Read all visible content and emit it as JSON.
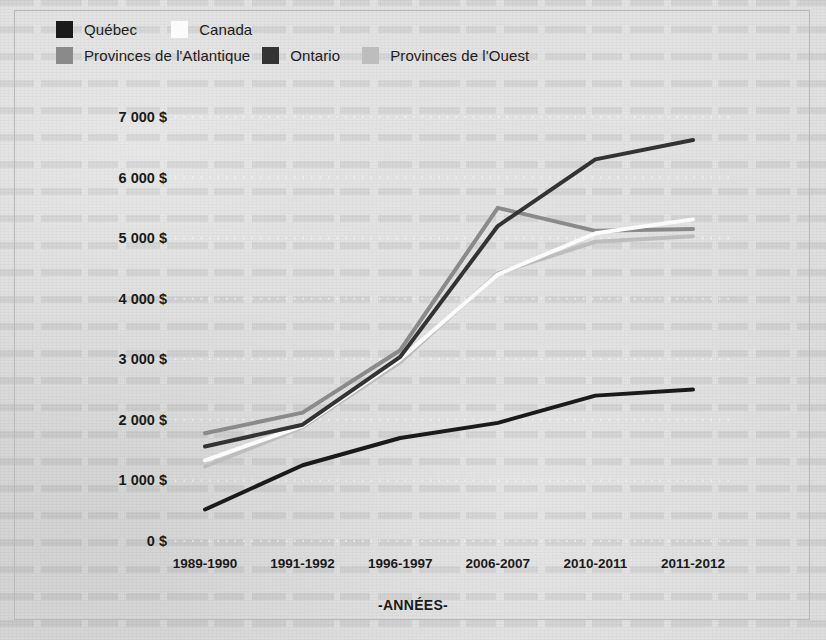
{
  "chart_data": {
    "type": "line",
    "title": "",
    "xlabel": "-ANNÉES-",
    "ylabel": "",
    "categories": [
      "1989-1990",
      "1991-1992",
      "1996-1997",
      "2006-2007",
      "2010-2011",
      "2011-2012"
    ],
    "ylim": [
      0,
      7000
    ],
    "ytick_values": [
      0,
      1000,
      2000,
      3000,
      4000,
      5000,
      6000,
      7000
    ],
    "ytick_labels": [
      "0 $",
      "1 000 $",
      "2 000 $",
      "3 000 $",
      "4 000 $",
      "5 000 $",
      "6 000 $",
      "7 000 $"
    ],
    "grid": "horizontal-dotted",
    "legend_position": "top-left",
    "series": [
      {
        "name": "Québec",
        "color": "#1a1a1a",
        "values": [
          520,
          1250,
          1700,
          1950,
          2400,
          2500
        ]
      },
      {
        "name": "Canada",
        "color": "#fbfbfb",
        "values": [
          1330,
          1900,
          3000,
          4400,
          5080,
          5310
        ]
      },
      {
        "name": "Provinces de l'Atlantique",
        "color": "#8a8a8a",
        "values": [
          1780,
          2120,
          3150,
          5500,
          5120,
          5150
        ]
      },
      {
        "name": "Ontario",
        "color": "#333333",
        "values": [
          1560,
          1920,
          3040,
          5200,
          6300,
          6620
        ]
      },
      {
        "name": "Provinces de l'Ouest",
        "color": "#bdbdbd",
        "values": [
          1230,
          1880,
          2950,
          4420,
          4940,
          5030
        ]
      }
    ]
  },
  "legend": {
    "rows": [
      [
        {
          "label": "Québec",
          "swatch": "#1a1a1a"
        },
        {
          "label": "Canada",
          "swatch": "#fbfbfb"
        }
      ],
      [
        {
          "label": "Provinces de l'Atlantique",
          "swatch": "#8a8a8a"
        },
        {
          "label": "Ontario",
          "swatch": "#333333"
        },
        {
          "label": "Provinces de l'Ouest",
          "swatch": "#bdbdbd"
        }
      ]
    ]
  },
  "axes": {
    "x_title": "-ANNÉES-"
  }
}
